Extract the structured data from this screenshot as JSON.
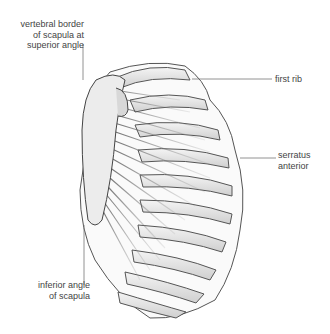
{
  "figure": {
    "labels": {
      "vertebral_border": [
        "vertebral border",
        "of scapula at",
        "superior angle"
      ],
      "first_rib": [
        "first rib"
      ],
      "serratus": [
        "serratus",
        "anterior"
      ],
      "inferior_angle": [
        "inferior angle",
        "of scapula"
      ]
    }
  }
}
